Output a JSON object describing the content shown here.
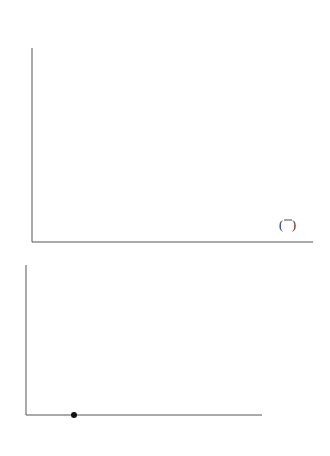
{
  "problem_number": "5.",
  "chart_data": [
    {
      "type": "line",
      "title": "",
      "xlabel": "",
      "ylabel": "",
      "xlim": [
        0,
        2.4
      ],
      "ylim": [
        0,
        10
      ],
      "x_ticks": [
        "0",
        "1",
        "2"
      ],
      "y_ticks": [
        "1",
        "2",
        "3",
        "4",
        "5",
        "6",
        "7",
        "8",
        "9",
        "10"
      ],
      "grid": false,
      "series": [
        {
          "name": "y = 5^x",
          "label_base": "y = 5",
          "label_exp": "x",
          "x": [
            0,
            0.2,
            0.4,
            0.6,
            0.8,
            1.0,
            1.2,
            1.37
          ],
          "values": [
            1,
            1.38,
            1.9,
            2.63,
            3.62,
            5.0,
            6.9,
            9.0
          ]
        },
        {
          "name": "y = 2^x",
          "label_base": "y = 2",
          "label_exp": "x",
          "x": [
            0,
            0.5,
            1.0,
            1.5,
            2.0,
            2.1
          ],
          "values": [
            1,
            1.41,
            2.0,
            2.83,
            4.0,
            4.29
          ]
        },
        {
          "name": "y = (1/2)^x",
          "label_base": "y =",
          "label_num": "1",
          "label_den": "2",
          "label_exp": "x",
          "x": [
            0,
            0.5,
            1.0,
            1.5,
            2.0,
            2.2
          ],
          "values": [
            1,
            0.71,
            0.5,
            0.35,
            0.25,
            0.22
          ]
        }
      ]
    },
    {
      "type": "line",
      "title": "",
      "xlabel": "",
      "ylabel": "",
      "xlim": [
        0,
        5
      ],
      "ylim": [
        0,
        3
      ],
      "x_ticks": [
        "1",
        "2",
        "3",
        "4",
        "5"
      ],
      "y_ticks": [
        "1",
        "2",
        "3"
      ],
      "grid": false,
      "series": [
        {
          "name": "y = log x",
          "label": "y = log x",
          "x": [
            1,
            2,
            3,
            4,
            5
          ],
          "values": [
            0,
            0.9,
            1.44,
            1.86,
            2.16
          ]
        }
      ],
      "annotations": [
        {
          "type": "point",
          "x": 1,
          "y": 0
        }
      ]
    }
  ]
}
